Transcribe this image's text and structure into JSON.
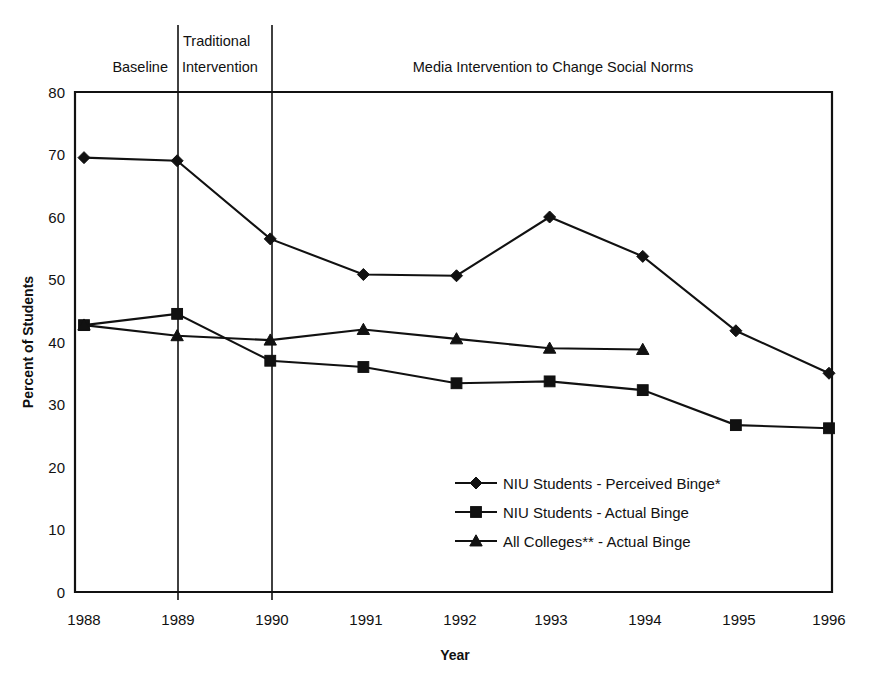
{
  "chart_data": {
    "type": "line",
    "title": "",
    "xlabel": "Year",
    "ylabel": "Percent of Students",
    "categories": [
      "1988",
      "1989",
      "1990",
      "1991",
      "1992",
      "1993",
      "1994",
      "1995",
      "1996"
    ],
    "x": [
      1988,
      1989,
      1990,
      1991,
      1992,
      1993,
      1994,
      1995,
      1996
    ],
    "xlim": [
      1988,
      1996
    ],
    "ylim": [
      0,
      80
    ],
    "ytick_labels": [
      "0",
      "10",
      "20",
      "30",
      "40",
      "50",
      "60",
      "70",
      "80"
    ],
    "ytick_values": [
      0,
      10,
      20,
      30,
      40,
      50,
      60,
      70,
      80
    ],
    "grid": false,
    "legend_position": "inside-lower-center",
    "series": [
      {
        "name": "NIU Students - Perceived Binge*",
        "marker": "diamond",
        "values": [
          69.5,
          69.0,
          56.5,
          50.8,
          50.6,
          60.0,
          53.7,
          41.8,
          35.0
        ]
      },
      {
        "name": "NIU Students - Actual Binge",
        "marker": "square",
        "values": [
          42.7,
          44.5,
          37.0,
          36.0,
          33.4,
          33.7,
          32.3,
          26.7,
          26.2
        ]
      },
      {
        "name": "All Colleges** - Actual Binge",
        "marker": "triangle",
        "values": [
          42.7,
          41.0,
          40.3,
          42.0,
          40.5,
          39.0,
          38.8,
          null,
          null
        ]
      }
    ],
    "annotations": [
      {
        "label": "Baseline",
        "span": [
          "1988",
          "1989"
        ]
      },
      {
        "label": "Traditional\nIntervention",
        "span": [
          "1989",
          "1990"
        ]
      },
      {
        "label": "Media Intervention to Change Social Norms",
        "span": [
          "1990",
          "1996"
        ]
      }
    ],
    "phase_labels": {
      "baseline": "Baseline",
      "traditional_line1": "Traditional",
      "traditional_line2": "Intervention",
      "media": "Media Intervention to Change Social Norms"
    },
    "legend_entries": [
      "NIU Students - Perceived Binge*",
      "NIU Students - Actual Binge",
      "All Colleges** - Actual Binge"
    ],
    "colors": {
      "ink": "#111111",
      "background": "#ffffff"
    }
  }
}
